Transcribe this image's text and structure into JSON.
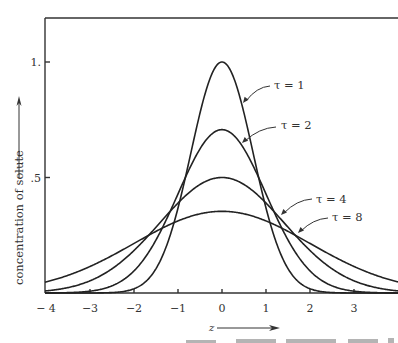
{
  "chart_data": {
    "type": "line",
    "title": "",
    "xlabel": "z",
    "ylabel": "concentration of solute",
    "xlim": [
      -4,
      4
    ],
    "ylim": [
      0,
      1.2
    ],
    "grid": false,
    "legend": "inline leader-line labels",
    "x_ticks": [
      -4,
      -3,
      -2,
      -1,
      0,
      1,
      2,
      3
    ],
    "x_tick_labels": [
      "− 4",
      "−3",
      "−2",
      "−1",
      "0",
      "1",
      "2",
      "3"
    ],
    "y_ticks": [
      0.5,
      1.0
    ],
    "y_tick_labels": [
      ".5",
      "1."
    ],
    "formula": "c = tau^(-1/2) * exp(-z^2 / tau)",
    "series": [
      {
        "name": "τ = 1",
        "tau": 1,
        "peak": 1.0,
        "x": [
          -4,
          -3,
          -2,
          -1,
          0,
          1,
          2,
          3,
          4
        ],
        "values": [
          0.0,
          0.0001,
          0.018,
          0.368,
          1.0,
          0.368,
          0.018,
          0.0001,
          0.0
        ]
      },
      {
        "name": "τ = 2",
        "tau": 2,
        "peak": 0.707,
        "x": [
          -4,
          -3,
          -2,
          -1,
          0,
          1,
          2,
          3,
          4
        ],
        "values": [
          0.0002,
          0.008,
          0.096,
          0.429,
          0.707,
          0.429,
          0.096,
          0.008,
          0.0002
        ]
      },
      {
        "name": "τ = 4",
        "tau": 4,
        "peak": 0.5,
        "x": [
          -4,
          -3,
          -2,
          -1,
          0,
          1,
          2,
          3,
          4
        ],
        "values": [
          0.009,
          0.053,
          0.184,
          0.389,
          0.5,
          0.389,
          0.184,
          0.053,
          0.009
        ]
      },
      {
        "name": "τ = 8",
        "tau": 8,
        "peak": 0.354,
        "x": [
          -4,
          -3,
          -2,
          -1,
          0,
          1,
          2,
          3,
          4
        ],
        "values": [
          0.048,
          0.115,
          0.214,
          0.312,
          0.354,
          0.312,
          0.214,
          0.115,
          0.048
        ]
      }
    ],
    "annotations": [
      {
        "text": "τ = 1",
        "tx": 274,
        "ty": 89,
        "from": [
          243,
          103
        ],
        "to": [
          270,
          86
        ]
      },
      {
        "text": "τ = 2",
        "tx": 281,
        "ty": 129,
        "from": [
          242,
          143
        ],
        "to": [
          276,
          127
        ]
      },
      {
        "text": "τ = 4",
        "tx": 316,
        "ty": 203,
        "from": [
          281,
          215
        ],
        "to": [
          312,
          199
        ]
      },
      {
        "text": "τ = 8",
        "tx": 332,
        "ty": 221,
        "from": [
          298,
          233
        ],
        "to": [
          328,
          218
        ]
      }
    ]
  },
  "layout": {
    "x0_px": 222,
    "px_per_x": 44,
    "y0_px": 293,
    "px_per_y": 231,
    "left_px": 45,
    "right_px": 398,
    "top_px": 18
  }
}
